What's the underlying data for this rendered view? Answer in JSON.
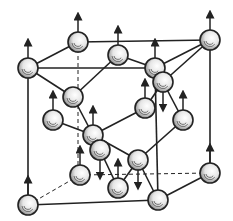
{
  "diagram": {
    "type": "crystal-lattice",
    "colors": {
      "line": "#222222",
      "background": "#ffffff",
      "atom_fill": "#f2f2f2",
      "atom_shade": "#555555"
    },
    "atoms": [
      {
        "id": "a1",
        "x": 78,
        "y": 42,
        "spin": "up"
      },
      {
        "id": "a2",
        "x": 210,
        "y": 40,
        "spin": "up"
      },
      {
        "id": "a3",
        "x": 28,
        "y": 68,
        "spin": "up"
      },
      {
        "id": "a4",
        "x": 155,
        "y": 68,
        "spin": "up"
      },
      {
        "id": "a5",
        "x": 118,
        "y": 55,
        "spin": "up"
      },
      {
        "id": "a6",
        "x": 163,
        "y": 82,
        "spin": "down"
      },
      {
        "id": "a7",
        "x": 73,
        "y": 97,
        "spin": "none"
      },
      {
        "id": "a8",
        "x": 53,
        "y": 120,
        "spin": "up"
      },
      {
        "id": "a9",
        "x": 145,
        "y": 108,
        "spin": "up"
      },
      {
        "id": "a10",
        "x": 183,
        "y": 120,
        "spin": "up"
      },
      {
        "id": "a11",
        "x": 93,
        "y": 135,
        "spin": "up"
      },
      {
        "id": "a12",
        "x": 100,
        "y": 150,
        "spin": "down"
      },
      {
        "id": "a13",
        "x": 138,
        "y": 160,
        "spin": "down"
      },
      {
        "id": "a14",
        "x": 80,
        "y": 175,
        "spin": "up"
      },
      {
        "id": "a15",
        "x": 118,
        "y": 188,
        "spin": "up"
      },
      {
        "id": "a16",
        "x": 28,
        "y": 205,
        "spin": "up"
      },
      {
        "id": "a17",
        "x": 158,
        "y": 200,
        "spin": "none"
      },
      {
        "id": "a18",
        "x": 210,
        "y": 173,
        "spin": "up"
      }
    ],
    "solid_lines": [
      [
        78,
        42,
        210,
        40
      ],
      [
        28,
        68,
        155,
        68
      ],
      [
        78,
        42,
        28,
        68
      ],
      [
        210,
        40,
        155,
        68
      ],
      [
        28,
        68,
        28,
        205
      ],
      [
        210,
        40,
        210,
        173
      ],
      [
        155,
        68,
        158,
        200
      ],
      [
        28,
        205,
        158,
        200
      ],
      [
        158,
        200,
        210,
        173
      ],
      [
        28,
        68,
        73,
        97
      ],
      [
        118,
        55,
        73,
        97
      ],
      [
        118,
        55,
        155,
        68
      ],
      [
        210,
        40,
        163,
        82
      ],
      [
        163,
        82,
        145,
        108
      ],
      [
        163,
        82,
        183,
        120
      ],
      [
        73,
        97,
        93,
        135
      ],
      [
        53,
        120,
        93,
        135
      ],
      [
        93,
        135,
        145,
        108
      ],
      [
        93,
        135,
        138,
        160
      ],
      [
        138,
        160,
        183,
        120
      ],
      [
        138,
        160,
        118,
        188
      ],
      [
        138,
        160,
        158,
        200
      ],
      [
        100,
        150,
        118,
        188
      ]
    ],
    "dashed_lines": [
      [
        78,
        42,
        78,
        175
      ],
      [
        28,
        205,
        80,
        175
      ],
      [
        80,
        175,
        210,
        173
      ]
    ]
  }
}
